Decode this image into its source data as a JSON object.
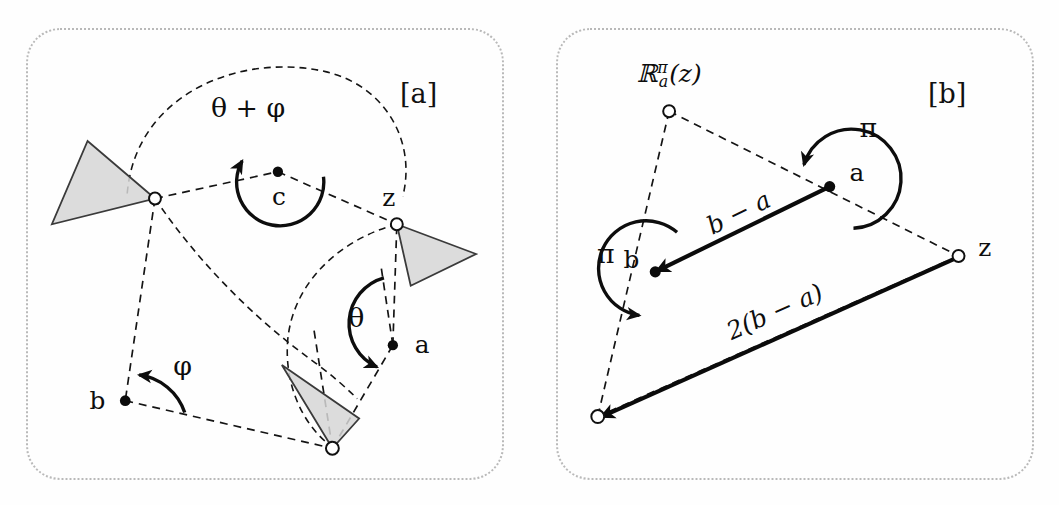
{
  "figure": {
    "kind": "two-panel geometric diagram of planar rotations",
    "background": "#ffffff",
    "line_color": "#141414",
    "triangle_fill": "#d6d6d6",
    "panel_border_color": "#b9b9b9"
  },
  "panels": [
    {
      "tag": "[a]",
      "id": "panel-a",
      "description": "composition of two rotations equals a single rotation by theta+phi about c",
      "angle_labels": [
        {
          "name": "theta-plus-phi",
          "text": "θ + φ",
          "about": "c"
        },
        {
          "name": "theta",
          "text": "θ",
          "about": "a"
        },
        {
          "name": "phi",
          "text": "φ",
          "about": "b"
        }
      ],
      "point_labels": [
        {
          "name": "point-c",
          "text": "c"
        },
        {
          "name": "point-z",
          "text": "z"
        },
        {
          "name": "point-a",
          "text": "a"
        },
        {
          "name": "point-b",
          "text": "b"
        }
      ]
    },
    {
      "tag": "[b]",
      "id": "panel-b",
      "description": "two half-turns compose to a translation by 2(b-a)",
      "angle_labels": [
        {
          "name": "pi-at-a",
          "text": "π",
          "about": "a"
        },
        {
          "name": "pi-at-b",
          "text": "π",
          "about": "b"
        }
      ],
      "point_labels": [
        {
          "name": "point-a",
          "text": "a"
        },
        {
          "name": "point-b",
          "text": "b"
        },
        {
          "name": "point-z",
          "text": "z"
        }
      ],
      "map_label": {
        "name": "rotation-map-label",
        "base": "ℝ",
        "subscript": "a",
        "superscript": "π",
        "argument": "(z)",
        "full": "ℝ_a^π(z)"
      },
      "vector_labels": [
        {
          "name": "vector-b-minus-a",
          "text": "b − a"
        },
        {
          "name": "vector-two-b-minus-a",
          "text": "2(b − a)"
        }
      ]
    }
  ]
}
